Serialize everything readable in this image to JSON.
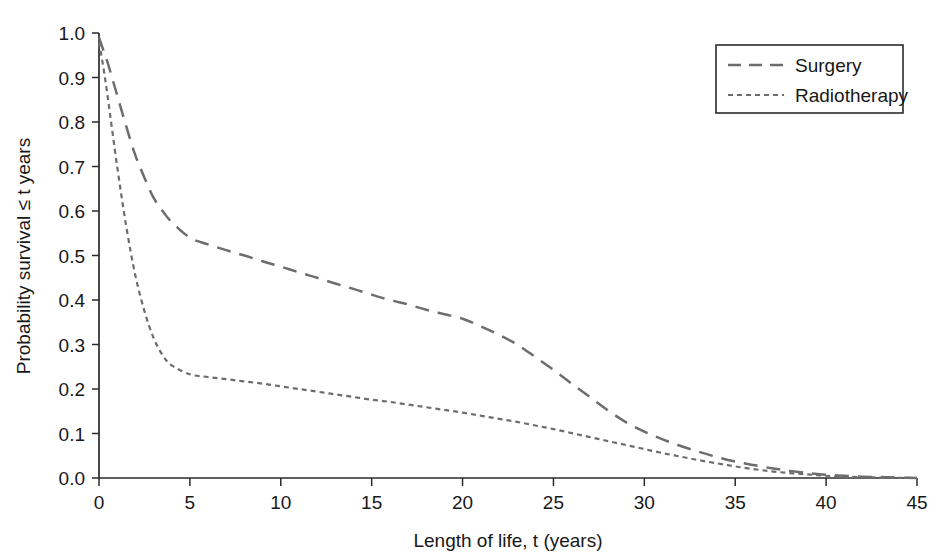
{
  "chart_data": {
    "type": "line",
    "title": "",
    "xlabel": "Length of life, t (years)",
    "ylabel": "Probability survival ≤ t years",
    "xlim": [
      0,
      45
    ],
    "ylim": [
      0.0,
      1.0
    ],
    "grid": false,
    "legend_position": "top-right",
    "xticks": [
      "0",
      "5",
      "10",
      "15",
      "20",
      "25",
      "30",
      "35",
      "40",
      "45"
    ],
    "xtick_values": [
      0,
      5,
      10,
      15,
      20,
      25,
      30,
      35,
      40,
      45
    ],
    "yticks": [
      "0.0",
      "0.1",
      "0.2",
      "0.3",
      "0.4",
      "0.5",
      "0.6",
      "0.7",
      "0.8",
      "0.9",
      "1.0"
    ],
    "ytick_values": [
      0.0,
      0.1,
      0.2,
      0.3,
      0.4,
      0.5,
      0.6,
      0.7,
      0.8,
      0.9,
      1.0
    ],
    "x": [
      0,
      0.25,
      0.5,
      1,
      1.5,
      2,
      2.5,
      3,
      3.5,
      4,
      5,
      6,
      7,
      8,
      9,
      10,
      11,
      12,
      13,
      14,
      15,
      16,
      17,
      18,
      19,
      20,
      21,
      22,
      23,
      24,
      25,
      26,
      27,
      28,
      29,
      30,
      31,
      32,
      33,
      34,
      35,
      36,
      37,
      38,
      39,
      40,
      41,
      42,
      43,
      44,
      45
    ],
    "series": [
      {
        "name": "Surgery",
        "dash": "long-dash",
        "color": "#6d6d6d",
        "values": [
          0.99,
          0.96,
          0.93,
          0.86,
          0.79,
          0.725,
          0.675,
          0.63,
          0.6,
          0.575,
          0.54,
          0.525,
          0.512,
          0.5,
          0.487,
          0.475,
          0.462,
          0.45,
          0.437,
          0.425,
          0.412,
          0.4,
          0.39,
          0.378,
          0.368,
          0.358,
          0.341,
          0.322,
          0.3,
          0.272,
          0.243,
          0.212,
          0.182,
          0.152,
          0.125,
          0.104,
          0.087,
          0.072,
          0.059,
          0.047,
          0.037,
          0.029,
          0.022,
          0.016,
          0.011,
          0.007,
          0.005,
          0.003,
          0.002,
          0.001,
          0.0
        ]
      },
      {
        "name": "Radiotherapy",
        "dash": "short-dash",
        "color": "#6d6d6d",
        "values": [
          0.98,
          0.92,
          0.85,
          0.7,
          0.565,
          0.455,
          0.375,
          0.315,
          0.276,
          0.253,
          0.233,
          0.227,
          0.222,
          0.217,
          0.212,
          0.206,
          0.2,
          0.194,
          0.188,
          0.182,
          0.176,
          0.171,
          0.165,
          0.159,
          0.153,
          0.147,
          0.14,
          0.133,
          0.126,
          0.118,
          0.11,
          0.101,
          0.092,
          0.083,
          0.074,
          0.065,
          0.056,
          0.048,
          0.04,
          0.033,
          0.026,
          0.02,
          0.015,
          0.011,
          0.008,
          0.005,
          0.003,
          0.002,
          0.001,
          0.0005,
          0.0
        ]
      }
    ]
  },
  "legend": {
    "items": [
      {
        "label": "Surgery",
        "swatch": "long-dash-swatch"
      },
      {
        "label": "Radiotherapy",
        "swatch": "short-dash-swatch"
      }
    ]
  }
}
